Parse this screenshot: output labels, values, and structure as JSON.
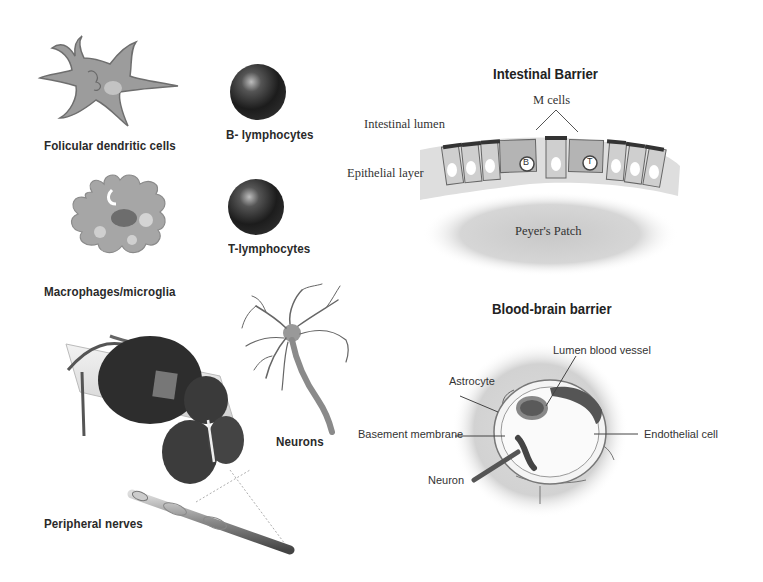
{
  "left_panel": {
    "cells": [
      {
        "id": "follicular-dendritic",
        "label": "Folicular dendritic cells"
      },
      {
        "id": "b-lymphocytes",
        "label": "B- lymphocytes"
      },
      {
        "id": "macrophages",
        "label": "Macrophages/microglia"
      },
      {
        "id": "t-lymphocytes",
        "label": "T-lymphocytes"
      },
      {
        "id": "neurons",
        "label": "Neurons"
      },
      {
        "id": "peripheral-nerves",
        "label": "Peripheral nerves"
      }
    ]
  },
  "intestinal_barrier": {
    "title": "Intestinal Barrier",
    "labels": {
      "m_cells": "M cells",
      "lumen": "Intestinal lumen",
      "epithelial": "Epithelial layer",
      "peyers_patch": "Peyer's Patch",
      "b_marker": "B",
      "t_marker": "T"
    }
  },
  "blood_brain_barrier": {
    "title": "Blood-brain barrier",
    "labels": {
      "lumen_vessel": "Lumen blood vessel",
      "astrocyte": "Astrocyte",
      "basement_membrane": "Basement membrane",
      "endothelial": "Endothelial cell",
      "neuron": "Neuron"
    }
  }
}
